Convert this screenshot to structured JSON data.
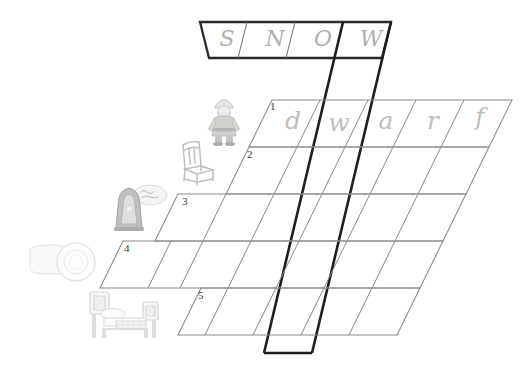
{
  "page": {
    "background_color": "#ffffff",
    "ink_color": "#3a3a3a",
    "pencil_color": "#bdbdbd"
  },
  "grid": {
    "skew_note": "parallelogram cells slanted to the right",
    "cell_width": 48,
    "cell_height": 47,
    "skew_offset": 23
  },
  "vertical_word": {
    "label": "SNOW",
    "letters": [
      "S",
      "N",
      "O",
      "W"
    ],
    "highlight_column_index": 3
  },
  "rows": [
    {
      "number": "1",
      "clue_icon": "dwarf-icon",
      "clue_label": "dwarf",
      "answer": "dwarf",
      "letters": [
        "d",
        "w",
        "a",
        "r",
        "f"
      ],
      "filled": true,
      "cells": 5
    },
    {
      "number": "2",
      "clue_icon": "chair-icon",
      "clue_label": "chair",
      "answer": "",
      "letters": [
        "",
        "",
        "",
        "",
        ""
      ],
      "filled": false,
      "cells": 5
    },
    {
      "number": "3",
      "clue_icon": "mirror-icon",
      "clue_label": "mirror",
      "answer": "",
      "letters": [
        "",
        "",
        "",
        ""
      ],
      "filled": false,
      "cells": 4
    },
    {
      "number": "4",
      "clue_icon": "plates-icon",
      "clue_label": "plates",
      "answer": "",
      "letters": [
        "",
        "",
        "",
        "",
        ""
      ],
      "filled": false,
      "cells": 5
    },
    {
      "number": "5",
      "clue_icon": "bed-icon",
      "clue_label": "bed",
      "answer": "",
      "letters": [
        "",
        "",
        "",
        ""
      ],
      "filled": false,
      "cells": 4
    }
  ]
}
